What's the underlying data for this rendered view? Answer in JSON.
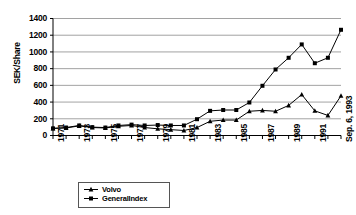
{
  "chart_data": {
    "type": "line",
    "title": "",
    "xlabel": "",
    "ylabel": "SEK/Share",
    "ylim": [
      0,
      1400
    ],
    "ytick_step": 200,
    "yticks": [
      1400,
      1200,
      1000,
      800,
      600,
      400,
      200,
      0
    ],
    "grid": true,
    "legend_position": "bottom-left",
    "categories": [
      "1971",
      "1972",
      "1973",
      "1974",
      "1975",
      "1976",
      "1977",
      "1978",
      "1979",
      "1980",
      "1981",
      "1982",
      "1983",
      "1984",
      "1985",
      "1986",
      "1987",
      "1988",
      "1989",
      "1990",
      "1991",
      "1992",
      "Sep. 6, 1993"
    ],
    "xtick_labels_shown": [
      "1971",
      "1973",
      "1975",
      "1977",
      "1979",
      "1981",
      "1983",
      "1985",
      "1987",
      "1989",
      "1991",
      "Sep. 6, 1993"
    ],
    "series": [
      {
        "name": "Volvo",
        "marker": "triangle",
        "color": "#000000",
        "values": [
          85,
          90,
          115,
          95,
          90,
          110,
          120,
          95,
          80,
          70,
          60,
          95,
          170,
          185,
          185,
          290,
          300,
          290,
          360,
          490,
          295,
          240,
          475
        ]
      },
      {
        "name": "GeneralIndex",
        "marker": "square",
        "color": "#000000",
        "values": [
          85,
          95,
          120,
          100,
          95,
          120,
          130,
          120,
          125,
          120,
          120,
          195,
          295,
          305,
          305,
          395,
          595,
          790,
          930,
          1090,
          865,
          930,
          1265
        ]
      }
    ]
  },
  "axis": {
    "y_title": "SEK/Share"
  },
  "legend": {
    "entries": [
      {
        "label": "Volvo",
        "marker": "triangle"
      },
      {
        "label": "GeneralIndex",
        "marker": "square"
      }
    ]
  }
}
